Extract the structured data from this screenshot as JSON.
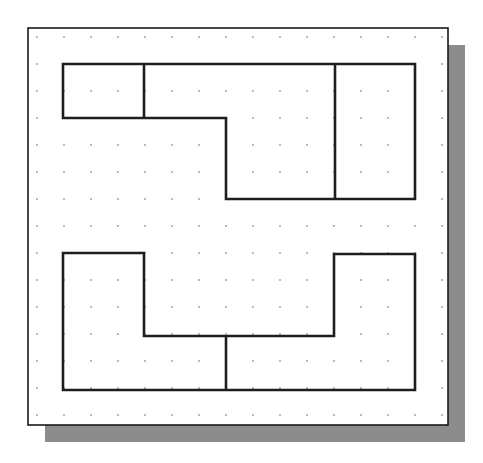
{
  "canvas": {
    "width": 483,
    "height": 463,
    "background": "#ffffff"
  },
  "frame": {
    "x": 28,
    "y": 28,
    "width": 420,
    "height": 397,
    "stroke": "#1a1a1a",
    "fill": "#ffffff"
  },
  "shadow": {
    "offset_x": 17,
    "offset_y": 17,
    "color": "#8c8c8c"
  },
  "grid": {
    "origin_x": 37,
    "origin_y": 37,
    "spacing": 27,
    "cols": 16,
    "rows": 15,
    "dot_color": "#9a9a9a",
    "dot_radius": 0.9
  },
  "line_color": "#1e1e1e",
  "line_width": 2.6,
  "shapes": [
    {
      "name": "top-view-outline",
      "points": [
        [
          63,
          64
        ],
        [
          415,
          64
        ],
        [
          415,
          199
        ],
        [
          226,
          199
        ],
        [
          226,
          118
        ],
        [
          63,
          118
        ]
      ]
    },
    {
      "name": "top-view-divider-left",
      "points": [
        [
          144,
          64
        ],
        [
          144,
          118
        ]
      ]
    },
    {
      "name": "top-view-divider-right",
      "points": [
        [
          335,
          64
        ],
        [
          335,
          199
        ]
      ]
    },
    {
      "name": "front-view-outline",
      "points": [
        [
          63,
          253
        ],
        [
          144,
          253
        ],
        [
          144,
          336
        ],
        [
          334,
          336
        ],
        [
          334,
          254
        ],
        [
          415,
          254
        ],
        [
          415,
          390
        ],
        [
          63,
          390
        ]
      ]
    },
    {
      "name": "front-view-divider",
      "points": [
        [
          226,
          336
        ],
        [
          226,
          390
        ]
      ]
    }
  ]
}
